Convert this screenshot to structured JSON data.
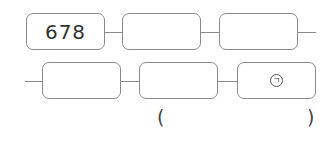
{
  "diagram": {
    "row1": [
      {
        "value": "678"
      },
      {
        "value": ""
      },
      {
        "value": ""
      }
    ],
    "row2": [
      {
        "value": ""
      },
      {
        "value": ""
      },
      {
        "value": "㉠",
        "marker": "ㄱ"
      }
    ],
    "answer": {
      "open": "(",
      "close": ")",
      "value": ""
    }
  }
}
